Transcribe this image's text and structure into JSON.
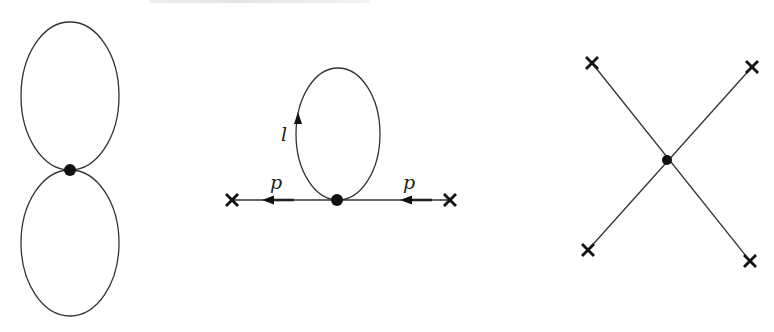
{
  "figure": {
    "colors": {
      "line": "#333333",
      "vertex": "#111111",
      "background": "#ffffff"
    }
  },
  "diagrams": [
    {
      "name": "figure-eight-vacuum",
      "vertex": {
        "x": 70,
        "y": 170
      },
      "loops": [
        {
          "cx": 70,
          "cy": 96,
          "rx": 49,
          "ry": 74
        },
        {
          "cx": 70,
          "cy": 243,
          "rx": 49,
          "ry": 73
        }
      ]
    },
    {
      "name": "tadpole-self-energy",
      "vertex": {
        "x": 337,
        "y": 200
      },
      "loop": {
        "cx": 338,
        "cy": 134,
        "rx": 42,
        "ry": 66
      },
      "loop_label": "l",
      "external_labels": [
        "p",
        "p"
      ],
      "external_points": [
        {
          "x": 232,
          "y": 200
        },
        {
          "x": 450,
          "y": 200
        }
      ]
    },
    {
      "name": "four-point-vertex",
      "vertex": {
        "x": 667,
        "y": 160
      },
      "external_points": [
        {
          "x": 592,
          "y": 63
        },
        {
          "x": 752,
          "y": 67
        },
        {
          "x": 588,
          "y": 250
        },
        {
          "x": 750,
          "y": 261
        }
      ]
    }
  ]
}
